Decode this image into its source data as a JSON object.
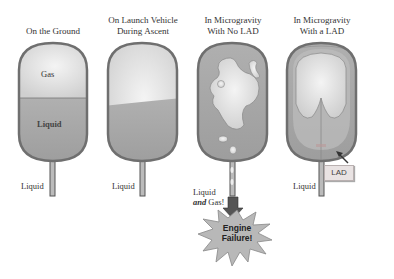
{
  "panels": [
    {
      "title_line1": "",
      "title_line2": "On the Ground",
      "inner_labels": {
        "gas": "Gas",
        "liquid": "Liquid"
      },
      "outlet_label": "Liquid"
    },
    {
      "title_line1": "On Launch Vehicle",
      "title_line2": "During Ascent",
      "outlet_label": "Liquid"
    },
    {
      "title_line1": "In Microgravity",
      "title_line2": "With No LAD",
      "outlet_label_line1": "Liquid",
      "outlet_label_line2_italic": "and",
      "outlet_label_line2_rest": " Gas!"
    },
    {
      "title_line1": "In Microgravity",
      "title_line2": "With a LAD",
      "outlet_label": "Liquid",
      "callout": "LAD"
    }
  ],
  "engine_failure": {
    "line1": "Engine",
    "line2": "Failure!"
  },
  "colors": {
    "tank_outline": "#6f6f6f",
    "liquid": "#a8a8a8",
    "gas": "#e2e2e2",
    "arrow": "#555555",
    "starburst": "#b5b5b5"
  }
}
